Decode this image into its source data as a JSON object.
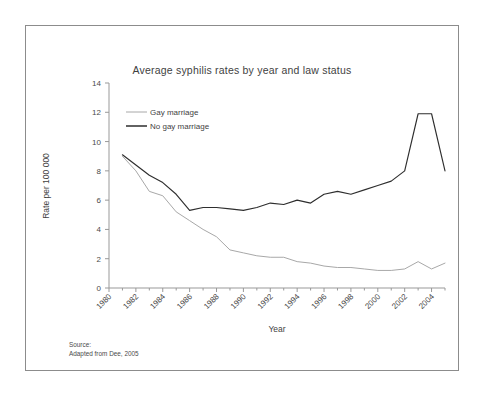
{
  "figure": {
    "source_note_label": "Source:",
    "source_note_text": "Adapted from Dee, 2005"
  },
  "chart_data": {
    "type": "line",
    "title": "Average syphilis rates by year and law status",
    "xlabel": "Year",
    "ylabel": "Rate per 100 000",
    "xlim": [
      1980,
      2005
    ],
    "ylim": [
      0,
      14
    ],
    "xticks": [
      1980,
      1982,
      1984,
      1986,
      1988,
      1990,
      1992,
      1994,
      1996,
      1998,
      2000,
      2002,
      2004
    ],
    "yticks": [
      0,
      2,
      4,
      6,
      8,
      10,
      12,
      14
    ],
    "grid": false,
    "legend_position": "upper-left-inside",
    "x": [
      1981,
      1982,
      1983,
      1984,
      1985,
      1986,
      1987,
      1988,
      1989,
      1990,
      1991,
      1992,
      1993,
      1994,
      1995,
      1996,
      1997,
      1998,
      1999,
      2000,
      2001,
      2002,
      2003,
      2004,
      2005
    ],
    "series": [
      {
        "name": "Gay marriage",
        "color": "#a8a8a8",
        "values": [
          9.0,
          8.0,
          6.6,
          6.3,
          5.2,
          4.6,
          4.0,
          3.5,
          2.6,
          2.4,
          2.2,
          2.1,
          2.1,
          1.8,
          1.7,
          1.5,
          1.4,
          1.4,
          1.3,
          1.2,
          1.2,
          1.3,
          1.8,
          1.3,
          1.7
        ]
      },
      {
        "name": "No gay marriage",
        "color": "#2e2e2e",
        "values": [
          9.1,
          8.4,
          7.7,
          7.2,
          6.4,
          5.3,
          5.5,
          5.5,
          5.4,
          5.3,
          5.5,
          5.8,
          5.7,
          6.0,
          5.8,
          6.4,
          6.6,
          6.4,
          6.7,
          7.0,
          7.3,
          8.0,
          11.9,
          11.9,
          8.0
        ]
      }
    ]
  },
  "axis": {
    "ytick_labels": [
      "0",
      "2",
      "4",
      "6",
      "8",
      "10",
      "12",
      "14"
    ],
    "xtick_labels": [
      "1980",
      "1982",
      "1984",
      "1986",
      "1988",
      "1990",
      "1992",
      "1994",
      "1996",
      "1998",
      "2000",
      "2002",
      "2004"
    ]
  }
}
